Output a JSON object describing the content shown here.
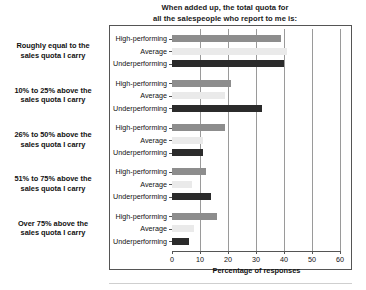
{
  "chart_data": {
    "type": "bar",
    "orientation": "horizontal",
    "title": "When added up, the total quota for all the salespeople who report to me is:",
    "title_lines": [
      "When added up, the total quota for",
      "all the salespeople who report to me is:"
    ],
    "xlabel": "Percentage of responses",
    "ylabel": "",
    "xlim": [
      0,
      60
    ],
    "xticks": [
      0,
      10,
      20,
      30,
      40,
      50,
      60
    ],
    "xtick_labels": [
      "0",
      "10",
      "20",
      "30",
      "40",
      "50",
      "60"
    ],
    "grid": true,
    "grid_axis": "x",
    "legend": false,
    "categories": [
      "Roughly equal to the sales quota I carry",
      "10% to 25% above the sales quota I carry",
      "26% to 50% above the sales quota I carry",
      "51% to 75% above the sales quota I carry",
      "Over 75% above the sales quota I carry"
    ],
    "category_lines": [
      [
        "Roughly equal to the",
        "sales quota I carry"
      ],
      [
        "10% to 25% above the",
        "sales quota I carry"
      ],
      [
        "26% to 50% above the",
        "sales quota I carry"
      ],
      [
        "51% to 75% above the",
        "sales quota I carry"
      ],
      [
        "Over 75% above the",
        "sales quota I carry"
      ]
    ],
    "series": [
      {
        "name": "High-performing",
        "color": "#8d8d8d",
        "values": [
          39,
          21,
          19,
          12,
          16
        ]
      },
      {
        "name": "Average",
        "color": "#eaeaea",
        "values": [
          41,
          19,
          11,
          7,
          8
        ]
      },
      {
        "name": "Underperforming",
        "color": "#2b2b2b",
        "values": [
          40,
          32,
          11,
          14,
          6
        ]
      }
    ]
  },
  "series_names": [
    "High-performing",
    "Average",
    "Underperforming"
  ],
  "colors": {
    "high_performing": "#8d8d8d",
    "average": "#eaeaea",
    "underperforming": "#2b2b2b",
    "axis": "#555555",
    "gridline": "#9a9a9a",
    "text": "#111111",
    "background": "#ffffff"
  }
}
